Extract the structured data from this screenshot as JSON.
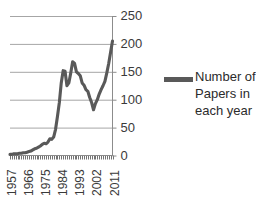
{
  "chart_data": {
    "type": "line",
    "title": "",
    "xlabel": "",
    "ylabel": "",
    "ylim": [
      0,
      250
    ],
    "yticks": [
      0,
      50,
      100,
      150,
      200,
      250
    ],
    "xticks": [
      1957,
      1966,
      1975,
      1984,
      1993,
      2002,
      2011
    ],
    "xlim": [
      1957,
      2011
    ],
    "grid": true,
    "legend_position": "right",
    "series": [
      {
        "name": "Number of Papers in each year",
        "color": "#595959",
        "x": [
          1957,
          1958,
          1959,
          1960,
          1961,
          1962,
          1963,
          1964,
          1965,
          1966,
          1967,
          1968,
          1969,
          1970,
          1971,
          1972,
          1973,
          1974,
          1975,
          1976,
          1977,
          1978,
          1979,
          1980,
          1981,
          1982,
          1983,
          1984,
          1985,
          1986,
          1987,
          1988,
          1989,
          1990,
          1991,
          1992,
          1993,
          1994,
          1995,
          1996,
          1997,
          1998,
          1999,
          2000,
          2001,
          2002,
          2003,
          2004,
          2005,
          2006,
          2007,
          2008,
          2009,
          2010,
          2011
        ],
        "values": [
          2,
          2,
          3,
          3,
          3,
          4,
          4,
          5,
          5,
          6,
          7,
          8,
          10,
          12,
          13,
          15,
          17,
          20,
          22,
          21,
          24,
          30,
          29,
          33,
          47,
          70,
          95,
          130,
          152,
          151,
          125,
          130,
          148,
          168,
          165,
          150,
          147,
          143,
          130,
          126,
          118,
          115,
          104,
          95,
          82,
          93,
          100,
          110,
          118,
          125,
          133,
          148,
          165,
          185,
          205
        ]
      }
    ]
  },
  "legend": {
    "label": "Number of Papers in each year"
  },
  "axis": {
    "y_labels": [
      "250",
      "200",
      "150",
      "100",
      "50",
      "0"
    ],
    "x_labels": [
      "1957",
      "1966",
      "1975",
      "1984",
      "1993",
      "2002",
      "2011"
    ]
  },
  "colors": {
    "line": "#595959",
    "grid": "#a6a6a6",
    "axis": "#808080",
    "text": "#3a3a3a"
  }
}
